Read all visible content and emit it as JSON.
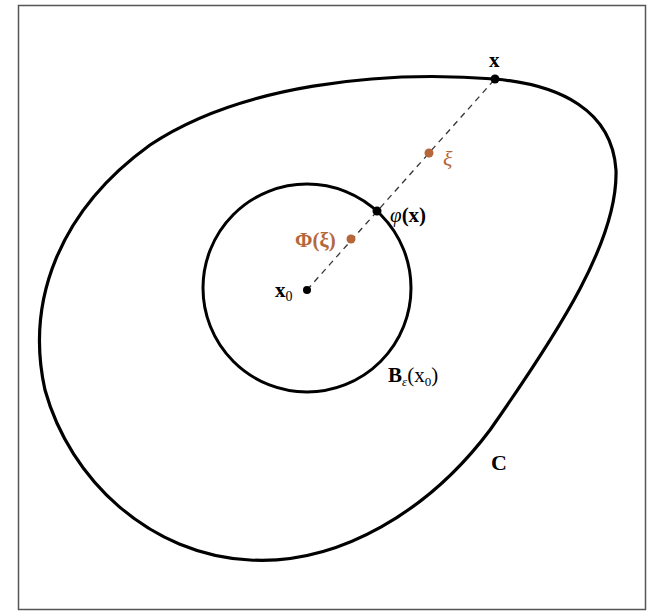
{
  "diagram": {
    "colors": {
      "curve": "#000000",
      "frame": "#555555",
      "accent": "#b5673a",
      "dash": "#333333"
    },
    "labels": {
      "x": "x",
      "xi": "ξ",
      "phi_x_func": "φ",
      "phi_x_arg": "(x)",
      "Phi_xi": "Φ(ξ)",
      "x0_base": "x",
      "x0_sub": "0",
      "ball_B": "B",
      "ball_eps": "ε",
      "ball_open": "(x",
      "ball_sub": "0",
      "ball_close": ")",
      "C": "C"
    },
    "points": {
      "x": [
        495,
        79
      ],
      "xi": [
        429,
        153
      ],
      "phi_x": [
        377,
        211
      ],
      "Phi_xi": [
        351,
        239
      ],
      "x0": [
        307,
        290
      ]
    },
    "ball": {
      "center": [
        307,
        288
      ],
      "radius": 103
    }
  }
}
